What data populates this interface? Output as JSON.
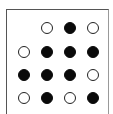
{
  "grid": {
    "rows": 4,
    "cols": 4,
    "cells": [
      [
        "empty",
        "hollow",
        "filled",
        "hollow"
      ],
      [
        "hollow",
        "filled",
        "filled",
        "filled"
      ],
      [
        "filled",
        "filled",
        "filled",
        "hollow"
      ],
      [
        "hollow",
        "filled",
        "hollow",
        "filled"
      ]
    ],
    "colors": {
      "filled": "#0a0a0a",
      "hollow_fill": "#ffffff",
      "stroke": "#222222"
    }
  }
}
